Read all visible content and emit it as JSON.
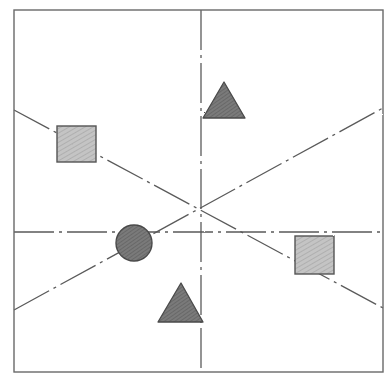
{
  "diagram": {
    "title": "",
    "style": "hand-drawn pencil sketch",
    "colors": {
      "background": "#ffffff",
      "line": "#5a5a5a",
      "frame": "#6a6a6a",
      "square_fill": "#b8b8b8",
      "dark_fill": "#6e6e6e"
    },
    "frame": {
      "x1": 14,
      "y1": 10,
      "x2": 383,
      "y2": 372
    },
    "center": {
      "x": 201,
      "y": 232
    },
    "axes": {
      "vertical": {
        "x": 201,
        "y1": 10,
        "y2": 372,
        "style": "dash-dot"
      },
      "horizontal": {
        "y": 232,
        "x1": 14,
        "x2": 383,
        "style": "dash-dot"
      }
    },
    "diagonals": [
      {
        "x1": 14,
        "y1": 110,
        "x2": 383,
        "y2": 308,
        "style": "dash-dot"
      },
      {
        "x1": 14,
        "y1": 310,
        "x2": 383,
        "y2": 108,
        "style": "dash-dot"
      }
    ],
    "shapes": [
      {
        "type": "square",
        "label": "square-upper-left",
        "x": 57,
        "y": 126,
        "w": 39,
        "h": 36,
        "fill": "light"
      },
      {
        "type": "square",
        "label": "square-lower-right",
        "x": 295,
        "y": 236,
        "w": 39,
        "h": 38,
        "fill": "light"
      },
      {
        "type": "circle",
        "label": "circle-left",
        "cx": 134,
        "cy": 243,
        "r": 18,
        "fill": "dark"
      },
      {
        "type": "triangle",
        "label": "triangle-upper",
        "points": [
          [
            224,
            82
          ],
          [
            203,
            118
          ],
          [
            245,
            118
          ]
        ],
        "fill": "dark"
      },
      {
        "type": "triangle",
        "label": "triangle-lower",
        "points": [
          [
            181,
            283
          ],
          [
            158,
            322
          ],
          [
            203,
            322
          ]
        ],
        "fill": "dark"
      }
    ]
  }
}
